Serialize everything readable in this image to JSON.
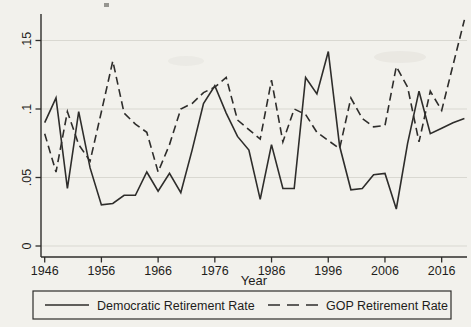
{
  "chart_data": {
    "type": "line",
    "x": [
      1946,
      1948,
      1950,
      1952,
      1954,
      1956,
      1958,
      1960,
      1962,
      1964,
      1966,
      1968,
      1970,
      1972,
      1974,
      1976,
      1978,
      1980,
      1982,
      1984,
      1986,
      1988,
      1990,
      1992,
      1994,
      1996,
      1998,
      2000,
      2002,
      2004,
      2006,
      2008,
      2010,
      2012,
      2014,
      2016,
      2018,
      2020
    ],
    "series": [
      {
        "name": "Democratic Retirement Rate",
        "style": "solid",
        "values": [
          0.09,
          0.108,
          0.042,
          0.098,
          0.057,
          0.03,
          0.031,
          0.037,
          0.037,
          0.054,
          0.04,
          0.053,
          0.039,
          0.07,
          0.104,
          0.117,
          0.097,
          0.08,
          0.07,
          0.034,
          0.074,
          0.042,
          0.042,
          0.123,
          0.111,
          0.142,
          0.073,
          0.041,
          0.042,
          0.052,
          0.053,
          0.027,
          0.075,
          0.113,
          0.082,
          0.086,
          0.09,
          0.093
        ]
      },
      {
        "name": "GOP Retirement Rate",
        "style": "dashed",
        "values": [
          0.082,
          0.054,
          0.098,
          0.074,
          0.062,
          0.098,
          0.135,
          0.097,
          0.089,
          0.083,
          0.054,
          0.074,
          0.1,
          0.104,
          0.112,
          0.116,
          0.123,
          0.092,
          0.085,
          0.078,
          0.121,
          0.076,
          0.1,
          0.096,
          0.083,
          0.077,
          0.071,
          0.108,
          0.093,
          0.087,
          0.088,
          0.131,
          0.116,
          0.076,
          0.113,
          0.099,
          0.132,
          0.165
        ]
      }
    ],
    "title": "",
    "xlabel": "Year",
    "ylabel": "",
    "x_ticks": [
      1946,
      1956,
      1966,
      1976,
      1986,
      1996,
      2006,
      2016
    ],
    "y_ticks": [
      0,
      0.05,
      0.1,
      0.15
    ],
    "y_tick_labels": [
      "0",
      ".05",
      ".1",
      ".15"
    ],
    "xlim": [
      1945.3,
      2020.7
    ],
    "ylim": [
      -0.008,
      0.169
    ],
    "grid": "horizontal",
    "legend_position": "bottom",
    "line_color": "#2e2d2b",
    "grid_color": "#d9d8d1",
    "background_color": "#f2f1ec"
  }
}
